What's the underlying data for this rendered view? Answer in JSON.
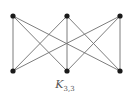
{
  "diagram": {
    "label_main": "K",
    "label_sub": "3,3",
    "edge_color": "#6e6e6e",
    "node_color": "#1a1a1a",
    "nodes": [
      {
        "id": "u1",
        "x": 13,
        "y": 16
      },
      {
        "id": "u2",
        "x": 67,
        "y": 16
      },
      {
        "id": "u3",
        "x": 120,
        "y": 16
      },
      {
        "id": "v1",
        "x": 13,
        "y": 71
      },
      {
        "id": "v2",
        "x": 67,
        "y": 71
      },
      {
        "id": "v3",
        "x": 120,
        "y": 71
      }
    ],
    "edges": [
      [
        "u1",
        "v1"
      ],
      [
        "u1",
        "v2"
      ],
      [
        "u1",
        "v3"
      ],
      [
        "u2",
        "v1"
      ],
      [
        "u2",
        "v2"
      ],
      [
        "u2",
        "v3"
      ],
      [
        "u3",
        "v1"
      ],
      [
        "u3",
        "v2"
      ],
      [
        "u3",
        "v3"
      ]
    ]
  }
}
